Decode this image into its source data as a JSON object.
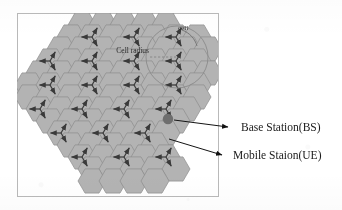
{
  "figure": {
    "type": "cellular-network-hexagon-layout",
    "background_color": "#ffffff",
    "frame": {
      "x": 17,
      "y": 13,
      "width": 201,
      "height": 183,
      "stroke": "#b9b9b9"
    },
    "cell_fill": "#b3b3b3",
    "cell_stroke": "#8c8c8c",
    "arrow_color": "#3a3a3a",
    "bs_marker_color": "#6e6e6e"
  },
  "annotations": {
    "cell_label": "cell",
    "cell_radius_label": "Cell radius",
    "radius_circle": {
      "cx": 177,
      "cy": 57,
      "r": 31,
      "stroke": "#8a8a8a"
    }
  },
  "legend": {
    "items": [
      {
        "id": "base-station",
        "label": "Base Station(BS)",
        "x": 241,
        "y": 127
      },
      {
        "id": "mobile-station",
        "label": "Mobile Staion(UE)",
        "x": 233,
        "y": 155
      }
    ]
  },
  "grid": {
    "hex_width": 28,
    "hex_height": 24.2,
    "orientation": "flat-top",
    "sector_count": 3,
    "sector_angles_deg": [
      180,
      300,
      60
    ],
    "cells": [
      {
        "cx": 82,
        "cy": 25,
        "sectors": false
      },
      {
        "cx": 103,
        "cy": 25,
        "sectors": false
      },
      {
        "cx": 124,
        "cy": 25,
        "sectors": false
      },
      {
        "cx": 145,
        "cy": 25,
        "sectors": false
      },
      {
        "cx": 166,
        "cy": 25,
        "sectors": false
      },
      {
        "cx": 71,
        "cy": 37,
        "sectors": false
      },
      {
        "cx": 92,
        "cy": 37,
        "sectors": true
      },
      {
        "cx": 113,
        "cy": 37,
        "sectors": false
      },
      {
        "cx": 134,
        "cy": 37,
        "sectors": true
      },
      {
        "cx": 155,
        "cy": 37,
        "sectors": false
      },
      {
        "cx": 176,
        "cy": 37,
        "sectors": true
      },
      {
        "cx": 197,
        "cy": 37,
        "sectors": false
      },
      {
        "cx": 61,
        "cy": 49,
        "sectors": false
      },
      {
        "cx": 82,
        "cy": 49,
        "sectors": false
      },
      {
        "cx": 103,
        "cy": 49,
        "sectors": false
      },
      {
        "cx": 124,
        "cy": 49,
        "sectors": false
      },
      {
        "cx": 145,
        "cy": 49,
        "sectors": false
      },
      {
        "cx": 166,
        "cy": 49,
        "sectors": false
      },
      {
        "cx": 187,
        "cy": 49,
        "sectors": false
      },
      {
        "cx": 208,
        "cy": 49,
        "sectors": false
      },
      {
        "cx": 50,
        "cy": 61,
        "sectors": true
      },
      {
        "cx": 71,
        "cy": 61,
        "sectors": false
      },
      {
        "cx": 92,
        "cy": 61,
        "sectors": true
      },
      {
        "cx": 113,
        "cy": 61,
        "sectors": false
      },
      {
        "cx": 134,
        "cy": 61,
        "sectors": true
      },
      {
        "cx": 155,
        "cy": 61,
        "sectors": false
      },
      {
        "cx": 176,
        "cy": 61,
        "sectors": true
      },
      {
        "cx": 197,
        "cy": 61,
        "sectors": false
      },
      {
        "cx": 40,
        "cy": 73,
        "sectors": false
      },
      {
        "cx": 61,
        "cy": 73,
        "sectors": false
      },
      {
        "cx": 82,
        "cy": 73,
        "sectors": false
      },
      {
        "cx": 103,
        "cy": 73,
        "sectors": false
      },
      {
        "cx": 124,
        "cy": 73,
        "sectors": false
      },
      {
        "cx": 145,
        "cy": 73,
        "sectors": false
      },
      {
        "cx": 166,
        "cy": 73,
        "sectors": false
      },
      {
        "cx": 187,
        "cy": 73,
        "sectors": false
      },
      {
        "cx": 208,
        "cy": 73,
        "sectors": false
      },
      {
        "cx": 29,
        "cy": 85,
        "sectors": false
      },
      {
        "cx": 50,
        "cy": 85,
        "sectors": true
      },
      {
        "cx": 71,
        "cy": 85,
        "sectors": false
      },
      {
        "cx": 92,
        "cy": 85,
        "sectors": true
      },
      {
        "cx": 113,
        "cy": 85,
        "sectors": false
      },
      {
        "cx": 134,
        "cy": 85,
        "sectors": true
      },
      {
        "cx": 155,
        "cy": 85,
        "sectors": false
      },
      {
        "cx": 176,
        "cy": 85,
        "sectors": true
      },
      {
        "cx": 197,
        "cy": 85,
        "sectors": false
      },
      {
        "cx": 29,
        "cy": 97,
        "sectors": false
      },
      {
        "cx": 50,
        "cy": 97,
        "sectors": false
      },
      {
        "cx": 71,
        "cy": 97,
        "sectors": false
      },
      {
        "cx": 92,
        "cy": 97,
        "sectors": false
      },
      {
        "cx": 113,
        "cy": 97,
        "sectors": false
      },
      {
        "cx": 134,
        "cy": 97,
        "sectors": false
      },
      {
        "cx": 155,
        "cy": 97,
        "sectors": false
      },
      {
        "cx": 176,
        "cy": 97,
        "sectors": false
      },
      {
        "cx": 197,
        "cy": 97,
        "sectors": false
      },
      {
        "cx": 40,
        "cy": 109,
        "sectors": true
      },
      {
        "cx": 61,
        "cy": 109,
        "sectors": false
      },
      {
        "cx": 82,
        "cy": 109,
        "sectors": true
      },
      {
        "cx": 103,
        "cy": 109,
        "sectors": false
      },
      {
        "cx": 124,
        "cy": 109,
        "sectors": true
      },
      {
        "cx": 145,
        "cy": 109,
        "sectors": false
      },
      {
        "cx": 166,
        "cy": 109,
        "sectors": true
      },
      {
        "cx": 187,
        "cy": 109,
        "sectors": false
      },
      {
        "cx": 50,
        "cy": 121,
        "sectors": false
      },
      {
        "cx": 71,
        "cy": 121,
        "sectors": false
      },
      {
        "cx": 92,
        "cy": 121,
        "sectors": false
      },
      {
        "cx": 113,
        "cy": 121,
        "sectors": false
      },
      {
        "cx": 134,
        "cy": 121,
        "sectors": false
      },
      {
        "cx": 155,
        "cy": 121,
        "sectors": false
      },
      {
        "cx": 176,
        "cy": 121,
        "sectors": false
      },
      {
        "cx": 61,
        "cy": 133,
        "sectors": true
      },
      {
        "cx": 82,
        "cy": 133,
        "sectors": false
      },
      {
        "cx": 103,
        "cy": 133,
        "sectors": true
      },
      {
        "cx": 124,
        "cy": 133,
        "sectors": false
      },
      {
        "cx": 145,
        "cy": 133,
        "sectors": true
      },
      {
        "cx": 166,
        "cy": 133,
        "sectors": false
      },
      {
        "cx": 71,
        "cy": 145,
        "sectors": false
      },
      {
        "cx": 92,
        "cy": 145,
        "sectors": false
      },
      {
        "cx": 113,
        "cy": 145,
        "sectors": false
      },
      {
        "cx": 134,
        "cy": 145,
        "sectors": false
      },
      {
        "cx": 155,
        "cy": 145,
        "sectors": false
      },
      {
        "cx": 82,
        "cy": 157,
        "sectors": true
      },
      {
        "cx": 103,
        "cy": 157,
        "sectors": false
      },
      {
        "cx": 124,
        "cy": 157,
        "sectors": true
      },
      {
        "cx": 145,
        "cy": 157,
        "sectors": false
      },
      {
        "cx": 166,
        "cy": 157,
        "sectors": true
      },
      {
        "cx": 92,
        "cy": 169,
        "sectors": false
      },
      {
        "cx": 113,
        "cy": 169,
        "sectors": false
      },
      {
        "cx": 134,
        "cy": 169,
        "sectors": false
      },
      {
        "cx": 155,
        "cy": 169,
        "sectors": false
      },
      {
        "cx": 176,
        "cy": 169,
        "sectors": false
      },
      {
        "cx": 92,
        "cy": 181,
        "sectors": false
      },
      {
        "cx": 113,
        "cy": 181,
        "sectors": false
      },
      {
        "cx": 134,
        "cy": 181,
        "sectors": false
      },
      {
        "cx": 155,
        "cy": 181,
        "sectors": false
      }
    ],
    "bs_marker": {
      "cx": 168,
      "cy": 119,
      "r": 5.2
    }
  },
  "leader_lines": {
    "base_station": {
      "x1": 174,
      "y1": 120,
      "x2": 228,
      "y2": 127
    },
    "mobile_station": {
      "x1": 169,
      "y1": 139,
      "x2": 222,
      "y2": 155
    },
    "cell": {
      "from": [
        182,
        30
      ],
      "to": [
        197,
        46
      ]
    },
    "cell_radius": {
      "x1": 150,
      "y1": 57,
      "x2": 177,
      "y2": 57
    }
  }
}
